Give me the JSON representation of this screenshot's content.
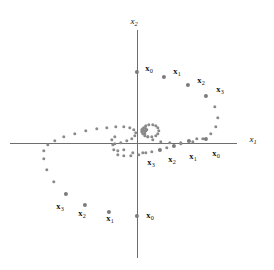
{
  "figure": {
    "background_color": "#ffffff",
    "dot_color": "#8a8a8a",
    "axis_color": "#6e6e6e",
    "label_color": "#111111",
    "width": 274,
    "height": 270
  },
  "axes": {
    "x_axis": {
      "label": "x",
      "subscript": "1",
      "label_x": 253,
      "label_y": 140,
      "name": "x-axis"
    },
    "y_axis": {
      "label": "x",
      "subscript": "2",
      "label_x": 134,
      "label_y": 22,
      "name": "y-axis"
    },
    "origin_x": 137,
    "origin_y": 143
  },
  "chart_data": {
    "type": "scatter",
    "title": "",
    "xlabel": "x_1",
    "ylabel": "x_2",
    "grid": false,
    "legend": false,
    "series": [
      {
        "name": "trajectory-A",
        "start_label": "x_0",
        "start_point": [
          137,
          72
        ],
        "points": [
          [
            137,
            72
          ],
          [
            164,
            77
          ],
          [
            188,
            85
          ],
          [
            206,
            96
          ],
          [
            215,
            107
          ],
          [
            218,
            118
          ],
          [
            216,
            127
          ],
          [
            211,
            134
          ],
          [
            203,
            139
          ],
          [
            193,
            142
          ],
          [
            181,
            143
          ],
          [
            170,
            143
          ],
          [
            161,
            142
          ],
          [
            153,
            140
          ],
          [
            148,
            137
          ],
          [
            145,
            134
          ],
          [
            144,
            131
          ],
          [
            144,
            128
          ],
          [
            146,
            126
          ],
          [
            149,
            125
          ],
          [
            153,
            125
          ],
          [
            156,
            126
          ],
          [
            158,
            128
          ],
          [
            159,
            131
          ],
          [
            158,
            134
          ],
          [
            156,
            136
          ],
          [
            152,
            137
          ],
          [
            148,
            137
          ],
          [
            145,
            136
          ],
          [
            143,
            134
          ],
          [
            142,
            132
          ],
          [
            142,
            130
          ],
          [
            143,
            129
          ],
          [
            145,
            128
          ],
          [
            146,
            129
          ],
          [
            147,
            130
          ],
          [
            146,
            131
          ],
          [
            145,
            132
          ],
          [
            144,
            131
          ]
        ]
      },
      {
        "name": "trajectory-B",
        "start_label": "x_0",
        "start_point": [
          137,
          216
        ],
        "points": [
          [
            137,
            216
          ],
          [
            109,
            212
          ],
          [
            85,
            205
          ],
          [
            66,
            194
          ],
          [
            54,
            182
          ],
          [
            47,
            170
          ],
          [
            44,
            159
          ],
          [
            44,
            151
          ],
          [
            48,
            145
          ],
          [
            55,
            141
          ],
          [
            64,
            137
          ],
          [
            75,
            134
          ],
          [
            86,
            131
          ],
          [
            97,
            129
          ],
          [
            107,
            128
          ],
          [
            116,
            127
          ],
          [
            124,
            127
          ],
          [
            130,
            128
          ],
          [
            134,
            130
          ],
          [
            136,
            133
          ],
          [
            135,
            136
          ],
          [
            132,
            139
          ],
          [
            127,
            141
          ],
          [
            121,
            143
          ],
          [
            115,
            144
          ],
          [
            124,
            150
          ],
          [
            133,
            153
          ],
          [
            143,
            153
          ],
          [
            152,
            152
          ],
          [
            160,
            150
          ],
          [
            167,
            148
          ],
          [
            174,
            146
          ],
          [
            181,
            144
          ],
          [
            189,
            141
          ],
          [
            197,
            139
          ],
          [
            206,
            139
          ],
          [
            118,
            151
          ],
          [
            114,
            150
          ],
          [
            118,
            155
          ],
          [
            124,
            156
          ],
          [
            131,
            156
          ],
          [
            139,
            155
          ],
          [
            146,
            153
          ],
          [
            113,
            145
          ],
          [
            112,
            140
          ],
          [
            115,
            137
          ]
        ]
      }
    ],
    "point_labels": [
      {
        "label": "x",
        "subscript": "0",
        "x": 149,
        "y": 69,
        "name": "label-x0-top",
        "trajectory": "A"
      },
      {
        "label": "x",
        "subscript": "1",
        "x": 177,
        "y": 72,
        "name": "label-x1-top",
        "trajectory": "A"
      },
      {
        "label": "x",
        "subscript": "2",
        "x": 201,
        "y": 81,
        "name": "label-x2-top",
        "trajectory": "A"
      },
      {
        "label": "x",
        "subscript": "3",
        "x": 220,
        "y": 90,
        "name": "label-x3-top",
        "trajectory": "A"
      },
      {
        "label": "x",
        "subscript": "0",
        "x": 216,
        "y": 154,
        "name": "label-x0-right",
        "trajectory": "B"
      },
      {
        "label": "x",
        "subscript": "1",
        "x": 193,
        "y": 157,
        "name": "label-x1-right",
        "trajectory": "B"
      },
      {
        "label": "x",
        "subscript": "2",
        "x": 172,
        "y": 160,
        "name": "label-x2-right",
        "trajectory": "B"
      },
      {
        "label": "x",
        "subscript": "3",
        "x": 151,
        "y": 163,
        "name": "label-x3-right",
        "trajectory": "B"
      },
      {
        "label": "x",
        "subscript": "3",
        "x": 60,
        "y": 207,
        "name": "label-x3-bottom",
        "trajectory": "B"
      },
      {
        "label": "x",
        "subscript": "2",
        "x": 82,
        "y": 214,
        "name": "label-x2-bottom",
        "trajectory": "B"
      },
      {
        "label": "x",
        "subscript": "1",
        "x": 110,
        "y": 219,
        "name": "label-x1-bottom",
        "trajectory": "B"
      },
      {
        "label": "x",
        "subscript": "0",
        "x": 150,
        "y": 216,
        "name": "label-x0-bottom",
        "trajectory": "B"
      }
    ],
    "emphasized_points": [
      [
        137,
        72
      ],
      [
        164,
        77
      ],
      [
        188,
        85
      ],
      [
        206,
        96
      ],
      [
        206,
        139
      ],
      [
        189,
        141
      ],
      [
        174,
        146
      ],
      [
        160,
        150
      ],
      [
        137,
        216
      ],
      [
        109,
        212
      ],
      [
        85,
        205
      ],
      [
        66,
        194
      ]
    ]
  }
}
